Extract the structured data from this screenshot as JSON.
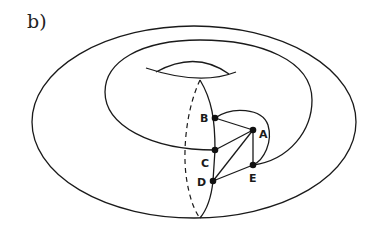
{
  "figure": {
    "label": "b)"
  },
  "colors": {
    "line": "#1a1a1a",
    "vertex": "#111111",
    "background": "#ffffff"
  },
  "torus": {
    "outer_ellipse": {
      "cx": 194,
      "cy": 122,
      "rx": 162,
      "ry": 96
    },
    "meridian": {
      "top": [
        200,
        80
      ],
      "bottom": [
        200,
        218
      ],
      "front_dashed": true
    }
  },
  "graph": {
    "vertices": [
      {
        "id": "A",
        "label": "A",
        "x": 253,
        "y": 130,
        "label_dx": 7,
        "label_dy": 8
      },
      {
        "id": "B",
        "label": "B",
        "x": 215,
        "y": 118,
        "label_dx": -14,
        "label_dy": 4
      },
      {
        "id": "C",
        "label": "C",
        "x": 215,
        "y": 150,
        "label_dx": -13,
        "label_dy": 17
      },
      {
        "id": "D",
        "label": "D",
        "x": 213,
        "y": 181,
        "label_dx": -15,
        "label_dy": 4
      },
      {
        "id": "E",
        "label": "E",
        "x": 253,
        "y": 165,
        "label_dx": -4,
        "label_dy": 17
      }
    ],
    "edges": [
      [
        "B",
        "A"
      ],
      [
        "C",
        "A"
      ],
      [
        "D",
        "A"
      ],
      [
        "A",
        "E"
      ],
      [
        "D",
        "E"
      ],
      [
        "B",
        "C"
      ],
      [
        "C",
        "D"
      ]
    ],
    "curved_edges": [
      "B-E around right",
      "E spiral to outer ring",
      "C spiral around hole"
    ]
  }
}
